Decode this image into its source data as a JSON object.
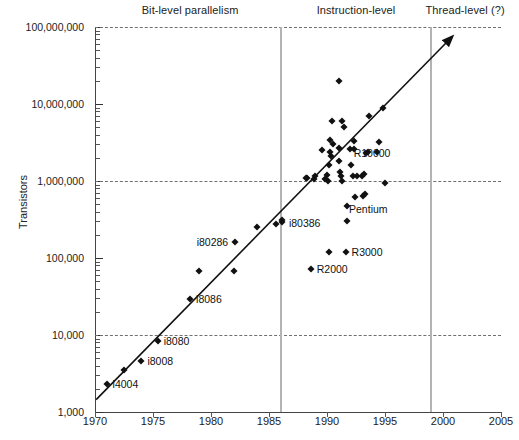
{
  "chart_data": {
    "type": "scatter",
    "title": "",
    "xlabel": "",
    "ylabel": "Transistors",
    "xlim": [
      1970,
      2005
    ],
    "ylim": [
      1000,
      100000000
    ],
    "yscale": "log",
    "grid": "horizontal-dashed-at-decades",
    "legend": "none",
    "xticks": [
      "1970",
      "1975",
      "1980",
      "1985",
      "1990",
      "1995",
      "2000",
      "2005"
    ],
    "yticks": [
      "1,000",
      "10,000",
      "100,000",
      "1,000,000",
      "10,000,000",
      "100,000,000"
    ],
    "era_bands": [
      {
        "label": "Bit-level parallelism",
        "start": 1970,
        "end": 1986,
        "label_year": 1978.2
      },
      {
        "label": "Instruction-level",
        "start": 1986,
        "end": 1999,
        "label_year": 1992.5
      },
      {
        "label": "Thread-level (?)",
        "start": 1999,
        "end": 2005,
        "label_year": 2001.9
      }
    ],
    "era_divider_years": [
      1986,
      1999
    ],
    "trend_line": {
      "from": [
        1970.1,
        1450
      ],
      "to": [
        2000.3,
        63000000
      ],
      "arrow": true
    },
    "annotations": [
      {
        "text": "i4004",
        "x": 1971.0,
        "y": 2300,
        "anchor": "right"
      },
      {
        "text": "i8008",
        "x": 1974.0,
        "y": 4600,
        "anchor": "right"
      },
      {
        "text": "i8080",
        "x": 1975.4,
        "y": 8300,
        "anchor": "right"
      },
      {
        "text": "i8086",
        "x": 1978.2,
        "y": 29000,
        "anchor": "right"
      },
      {
        "text": "i80286",
        "x": 1982.0,
        "y": 160000,
        "anchor": "left"
      },
      {
        "text": "i80386",
        "x": 1986.2,
        "y": 285000,
        "anchor": "right"
      },
      {
        "text": "R2000",
        "x": 1988.6,
        "y": 72000,
        "anchor": "right"
      },
      {
        "text": "R3000",
        "x": 1991.6,
        "y": 120000,
        "anchor": "right"
      },
      {
        "text": "R10000",
        "x": 1992.6,
        "y": 3000000,
        "anchor": "right"
      },
      {
        "text": "Pentium",
        "x": 1992.1,
        "y": 620000,
        "anchor": "right"
      }
    ],
    "points": [
      {
        "x": 1971.0,
        "y": 2300
      },
      {
        "x": 1972.5,
        "y": 3500
      },
      {
        "x": 1974.0,
        "y": 4600
      },
      {
        "x": 1975.4,
        "y": 8300
      },
      {
        "x": 1978.2,
        "y": 29000
      },
      {
        "x": 1979.0,
        "y": 68000
      },
      {
        "x": 1982.0,
        "y": 68000
      },
      {
        "x": 1982.1,
        "y": 160000
      },
      {
        "x": 1984.0,
        "y": 250000
      },
      {
        "x": 1985.6,
        "y": 275000
      },
      {
        "x": 1986.1,
        "y": 290000
      },
      {
        "x": 1986.15,
        "y": 310000
      },
      {
        "x": 1988.6,
        "y": 72000
      },
      {
        "x": 1990.2,
        "y": 120000
      },
      {
        "x": 1991.6,
        "y": 120000
      },
      {
        "x": 1988.3,
        "y": 1100000
      },
      {
        "x": 1988.9,
        "y": 1050000
      },
      {
        "x": 1989.8,
        "y": 1050000
      },
      {
        "x": 1990.0,
        "y": 1200000
      },
      {
        "x": 1990.1,
        "y": 1000000
      },
      {
        "x": 1990.2,
        "y": 1600000
      },
      {
        "x": 1990.3,
        "y": 2400000
      },
      {
        "x": 1990.35,
        "y": 2100000
      },
      {
        "x": 1990.4,
        "y": 6000000
      },
      {
        "x": 1991.3,
        "y": 6000000
      },
      {
        "x": 1991.0,
        "y": 2700000
      },
      {
        "x": 1991.05,
        "y": 1800000
      },
      {
        "x": 1991.1,
        "y": 1300000
      },
      {
        "x": 1991.2,
        "y": 1150000
      },
      {
        "x": 1991.25,
        "y": 1000000
      },
      {
        "x": 1990.5,
        "y": 3000000
      },
      {
        "x": 1991.5,
        "y": 5000000
      },
      {
        "x": 1992.0,
        "y": 2600000
      },
      {
        "x": 1992.1,
        "y": 1600000
      },
      {
        "x": 1992.2,
        "y": 1150000
      },
      {
        "x": 1992.6,
        "y": 1150000
      },
      {
        "x": 1993.0,
        "y": 1150000
      },
      {
        "x": 1993.2,
        "y": 1250000
      },
      {
        "x": 1993.4,
        "y": 2300000
      },
      {
        "x": 1993.5,
        "y": 2400000
      },
      {
        "x": 1993.6,
        "y": 7000000
      },
      {
        "x": 1994.3,
        "y": 2400000
      },
      {
        "x": 1994.5,
        "y": 3200000
      },
      {
        "x": 1994.8,
        "y": 9000000
      },
      {
        "x": 1995.0,
        "y": 950000
      },
      {
        "x": 1991.0,
        "y": 20000000
      },
      {
        "x": 1990.3,
        "y": 3400000
      },
      {
        "x": 1989.6,
        "y": 2500000
      },
      {
        "x": 1989.0,
        "y": 1150000
      },
      {
        "x": 1992.4,
        "y": 620000
      },
      {
        "x": 1993.1,
        "y": 640000
      },
      {
        "x": 1993.25,
        "y": 680000
      },
      {
        "x": 1991.7,
        "y": 480000
      },
      {
        "x": 1991.75,
        "y": 300000
      },
      {
        "x": 1988.2,
        "y": 1100000
      },
      {
        "x": 1992.3,
        "y": 3300000
      },
      {
        "x": 1992.35,
        "y": 2600000
      }
    ]
  }
}
